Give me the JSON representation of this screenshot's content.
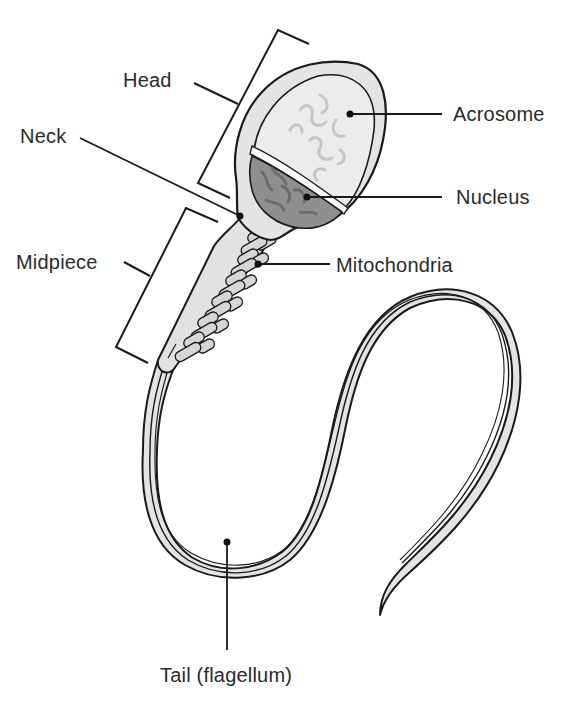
{
  "diagram": {
    "colors": {
      "outline": "#1a1a1a",
      "cell_fill": "#e2e2e2",
      "acrosome_fill": "#ececec",
      "acrosome_texture": "#c8c8c8",
      "nucleus_fill": "#8e8e8e",
      "nucleus_texture": "#6e6e6e",
      "mitochondria_fill": "#d4d4d4",
      "label_text": "#2a2a2a",
      "background": "#ffffff"
    },
    "labels": {
      "head": "Head",
      "neck": "Neck",
      "midpiece": "Midpiece",
      "acrosome": "Acrosome",
      "nucleus": "Nucleus",
      "mitochondria": "Mitochondria",
      "tail": "Tail (flagellum)"
    },
    "structures": [
      {
        "id": "head",
        "kind": "bracket-region",
        "label": "Head"
      },
      {
        "id": "neck",
        "kind": "point",
        "label": "Neck"
      },
      {
        "id": "midpiece",
        "kind": "bracket-region",
        "label": "Midpiece"
      },
      {
        "id": "acrosome",
        "kind": "point",
        "label": "Acrosome"
      },
      {
        "id": "nucleus",
        "kind": "point",
        "label": "Nucleus"
      },
      {
        "id": "mitochondria",
        "kind": "point",
        "label": "Mitochondria"
      },
      {
        "id": "tail",
        "kind": "point",
        "label": "Tail (flagellum)"
      }
    ]
  }
}
